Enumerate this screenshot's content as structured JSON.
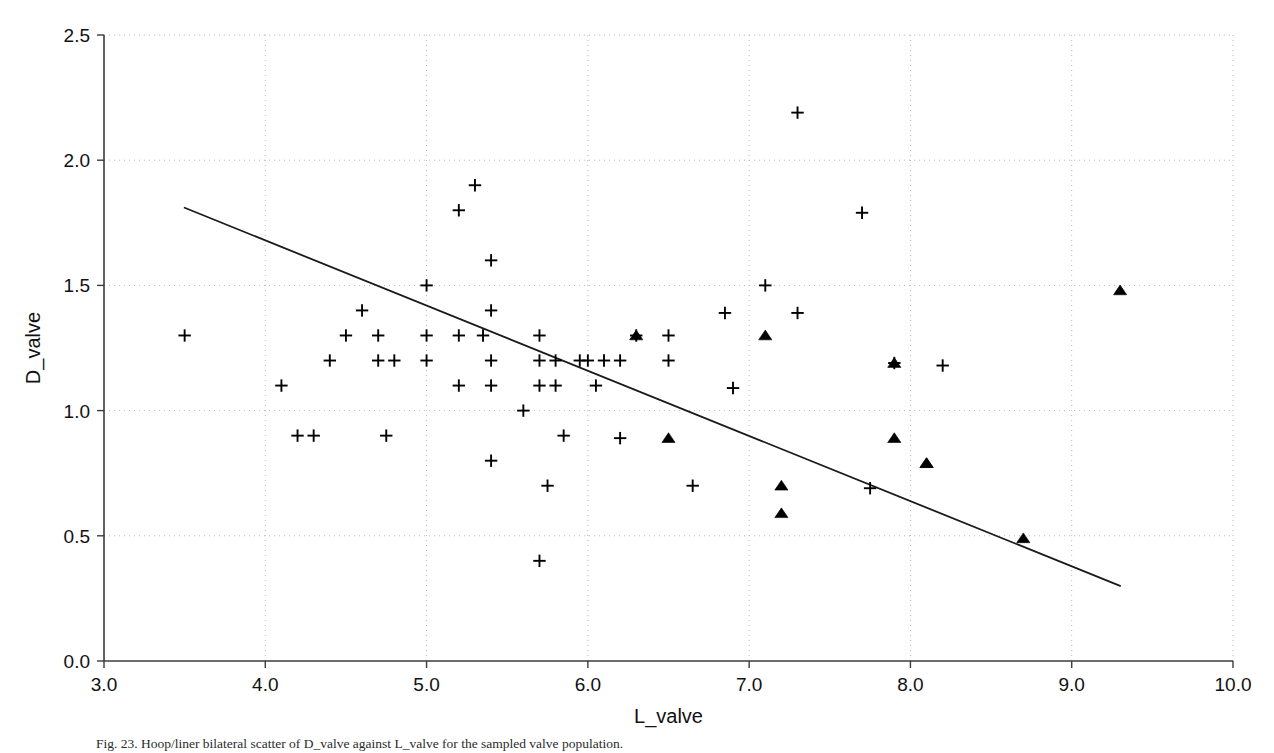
{
  "figure": {
    "caption": "Fig. 23. Hoop/liner bilateral scatter of D_valve against L_valve for the sampled valve population."
  },
  "chart_data": {
    "type": "scatter",
    "title": "",
    "xlabel": "L_valve",
    "ylabel": "D_valve",
    "xlim": [
      3.0,
      10.0
    ],
    "ylim": [
      0.0,
      2.5
    ],
    "xticks": [
      "3.0",
      "4.0",
      "5.0",
      "6.0",
      "7.0",
      "8.0",
      "9.0",
      "10.0"
    ],
    "yticks": [
      "0.0",
      "0.5",
      "1.0",
      "1.5",
      "2.0",
      "2.5"
    ],
    "xtick_values": [
      3.0,
      4.0,
      5.0,
      6.0,
      7.0,
      8.0,
      9.0,
      10.0
    ],
    "ytick_values": [
      0.0,
      0.5,
      1.0,
      1.5,
      2.0,
      2.5
    ],
    "grid": true,
    "grid_style": "dotted",
    "grid_color": "#b8b8b8",
    "axis_color": "#3c3c3c",
    "marker_color": "#000000",
    "legend": [],
    "legend_position": "none",
    "series": [
      {
        "name": "plus-group",
        "marker": "plus",
        "points": [
          [
            3.5,
            1.3
          ],
          [
            4.1,
            1.1
          ],
          [
            4.2,
            0.9
          ],
          [
            4.3,
            0.9
          ],
          [
            4.4,
            1.2
          ],
          [
            4.5,
            1.3
          ],
          [
            4.6,
            1.4
          ],
          [
            4.7,
            1.3
          ],
          [
            4.7,
            1.2
          ],
          [
            4.75,
            0.9
          ],
          [
            4.8,
            1.2
          ],
          [
            5.0,
            1.5
          ],
          [
            5.0,
            1.3
          ],
          [
            5.0,
            1.2
          ],
          [
            5.2,
            1.8
          ],
          [
            5.2,
            1.3
          ],
          [
            5.2,
            1.1
          ],
          [
            5.3,
            1.9
          ],
          [
            5.35,
            1.3
          ],
          [
            5.4,
            1.6
          ],
          [
            5.4,
            1.4
          ],
          [
            5.4,
            1.2
          ],
          [
            5.4,
            1.1
          ],
          [
            5.4,
            0.8
          ],
          [
            5.6,
            1.0
          ],
          [
            5.7,
            1.3
          ],
          [
            5.7,
            1.2
          ],
          [
            5.7,
            1.1
          ],
          [
            5.75,
            0.7
          ],
          [
            5.7,
            0.4
          ],
          [
            5.8,
            1.2
          ],
          [
            5.8,
            1.1
          ],
          [
            5.85,
            0.9
          ],
          [
            5.95,
            1.2
          ],
          [
            6.0,
            1.2
          ],
          [
            6.05,
            1.1
          ],
          [
            6.1,
            1.2
          ],
          [
            6.2,
            1.2
          ],
          [
            6.2,
            0.89
          ],
          [
            6.3,
            1.3
          ],
          [
            6.5,
            1.3
          ],
          [
            6.5,
            1.2
          ],
          [
            6.65,
            0.7
          ],
          [
            6.85,
            1.39
          ],
          [
            6.9,
            1.09
          ],
          [
            7.1,
            1.5
          ],
          [
            7.3,
            1.39
          ],
          [
            7.3,
            2.19
          ],
          [
            7.7,
            1.79
          ],
          [
            7.75,
            0.69
          ],
          [
            7.9,
            1.19
          ],
          [
            8.2,
            1.18
          ]
        ]
      },
      {
        "name": "triangle-group",
        "marker": "triangle",
        "points": [
          [
            6.3,
            1.3
          ],
          [
            6.5,
            0.89
          ],
          [
            7.1,
            1.3
          ],
          [
            7.2,
            0.7
          ],
          [
            7.2,
            0.59
          ],
          [
            7.9,
            1.19
          ],
          [
            7.9,
            0.89
          ],
          [
            8.1,
            0.79
          ],
          [
            8.1,
            0.79
          ],
          [
            8.7,
            0.49
          ],
          [
            9.3,
            1.48
          ]
        ]
      }
    ],
    "trendline": {
      "name": "regression-line",
      "x_start": 3.5,
      "y_start": 1.81,
      "x_end": 9.3,
      "y_end": 0.3,
      "color": "#1a1a1a"
    }
  }
}
